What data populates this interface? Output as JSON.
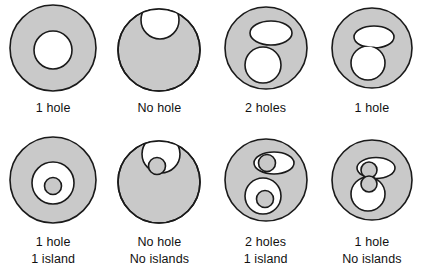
{
  "figure": {
    "fill_color": "#c9c9c9",
    "stroke_color": "#1a1a1a",
    "background_color": "#ffffff",
    "rows": 2,
    "columns": 4
  },
  "panels": [
    {
      "id": "panel-1",
      "row": 1,
      "column": 1,
      "shape_description": "Gray disk with one concentric white circular hole",
      "holes": 1,
      "islands": null,
      "caption_line1": "1 hole",
      "caption_line2": ""
    },
    {
      "id": "panel-2",
      "row": 1,
      "column": 2,
      "shape_description": "Gray disk with a white circle overlapping the top boundary forming a notch",
      "holes": 0,
      "islands": null,
      "caption_line1": "No hole",
      "caption_line2": ""
    },
    {
      "id": "panel-3",
      "row": 1,
      "column": 3,
      "shape_description": "Gray disk with two separate white holes, an upper ellipse and a lower circle",
      "holes": 2,
      "islands": null,
      "caption_line1": "2 holes",
      "caption_line2": ""
    },
    {
      "id": "panel-4",
      "row": 1,
      "column": 4,
      "shape_description": "Gray disk with an upper ellipse and lower circle merged into one figure-eight hole",
      "holes": 1,
      "islands": null,
      "caption_line1": "1 hole",
      "caption_line2": ""
    },
    {
      "id": "panel-5",
      "row": 2,
      "column": 1,
      "shape_description": "Gray disk with a white annular hole containing a small gray island",
      "holes": 1,
      "islands": 1,
      "caption_line1": "1 hole",
      "caption_line2": "1 island"
    },
    {
      "id": "panel-6",
      "row": 2,
      "column": 2,
      "shape_description": "Gray disk with a boundary notch containing a small gray circle touching the notch edge",
      "holes": 0,
      "islands": 0,
      "caption_line1": "No hole",
      "caption_line2": "No islands"
    },
    {
      "id": "panel-7",
      "row": 2,
      "column": 3,
      "shape_description": "Gray disk with two white holes, the upper containing a gray circle touching its edge and the lower containing a free gray island",
      "holes": 2,
      "islands": 1,
      "caption_line1": "2 holes",
      "caption_line2": "1 island"
    },
    {
      "id": "panel-8",
      "row": 2,
      "column": 4,
      "shape_description": "Gray disk with merged figure-eight hole containing two gray circles that touch each other and the hole boundary",
      "holes": 1,
      "islands": 0,
      "caption_line1": "1 hole",
      "caption_line2": "No islands"
    }
  ]
}
